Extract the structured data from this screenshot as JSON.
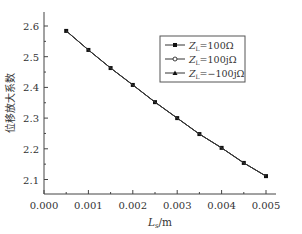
{
  "chart_data": {
    "type": "line",
    "title": "",
    "xlabel": "L_s/m",
    "xlabel_main": "L",
    "xlabel_sub": "s",
    "xlabel_unit": "/m",
    "ylabel": "位移放大系数",
    "xlim": [
      0.0,
      0.0052
    ],
    "ylim": [
      2.05,
      2.65
    ],
    "x_ticks": [
      "0.000",
      "0.001",
      "0.002",
      "0.003",
      "0.004",
      "0.005"
    ],
    "y_ticks": [
      "2.1",
      "2.2",
      "2.3",
      "2.4",
      "2.5",
      "2.6"
    ],
    "grid": false,
    "legend_position": "upper right",
    "x": [
      0.0005,
      0.001,
      0.0015,
      0.002,
      0.0025,
      0.003,
      0.0035,
      0.004,
      0.0045,
      0.005
    ],
    "series": [
      {
        "name": "Z_L=100Ω",
        "label_main": "Z",
        "label_sub": "L",
        "label_rest": "=100Ω",
        "marker": "square",
        "values": [
          2.584,
          2.522,
          2.463,
          2.408,
          2.352,
          2.3,
          2.248,
          2.203,
          2.154,
          2.111
        ]
      },
      {
        "name": "Z_L=100jΩ",
        "label_main": "Z",
        "label_sub": "L",
        "label_rest": "=100jΩ",
        "marker": "circle-open",
        "values": [
          2.584,
          2.522,
          2.463,
          2.408,
          2.352,
          2.3,
          2.248,
          2.203,
          2.154,
          2.111
        ]
      },
      {
        "name": "Z_L=−100jΩ",
        "label_main": "Z",
        "label_sub": "L",
        "label_rest": "=−100jΩ",
        "marker": "triangle",
        "values": [
          2.584,
          2.522,
          2.463,
          2.408,
          2.352,
          2.3,
          2.248,
          2.203,
          2.154,
          2.111
        ]
      }
    ]
  }
}
